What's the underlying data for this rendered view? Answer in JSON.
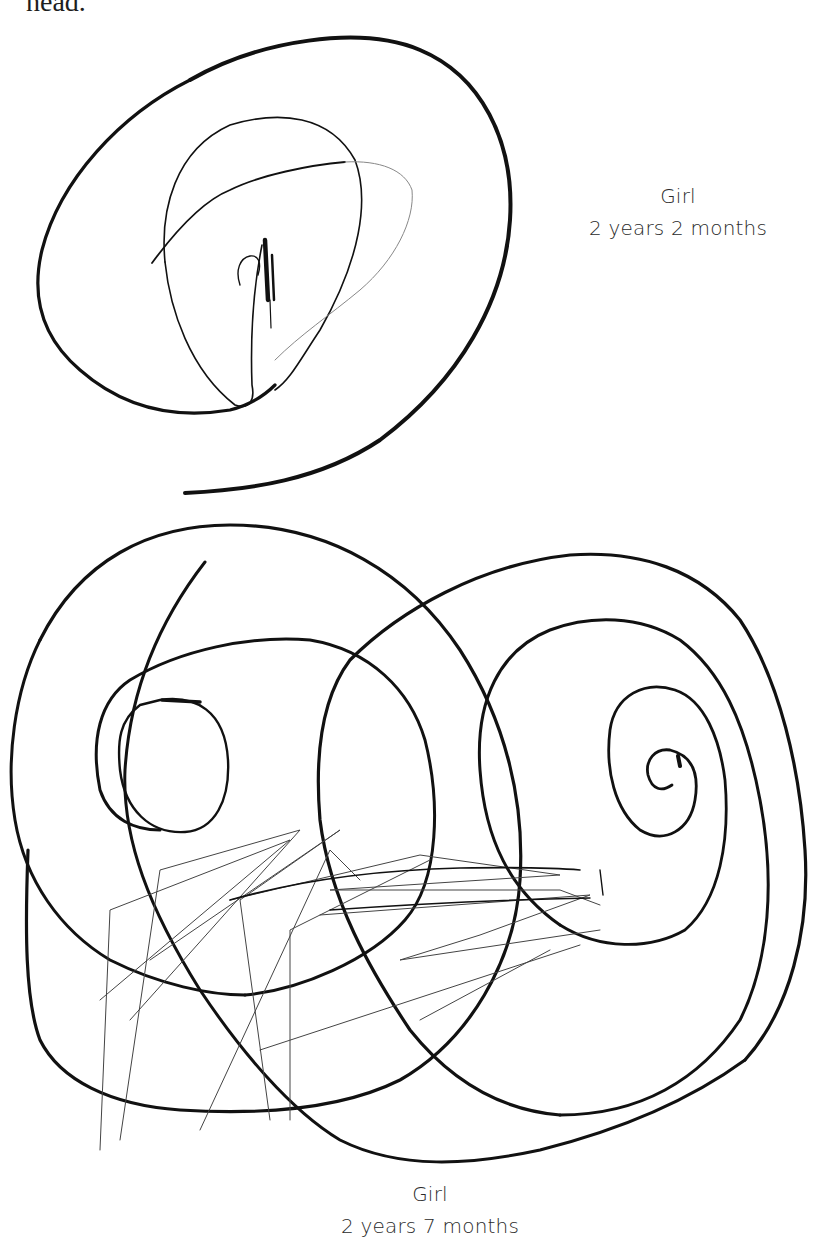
{
  "page": {
    "top_text_fragment": "head.",
    "figures": [
      {
        "caption_line1": "Girl",
        "caption_line2": "2 years 2 months",
        "description": "scribble drawing: large open spiral with inner loops"
      },
      {
        "caption_line1": "Girl",
        "caption_line2": "2 years 7 months",
        "description": "scribble drawing: two overlapping spiral circles with crossing hatch lines"
      }
    ]
  }
}
